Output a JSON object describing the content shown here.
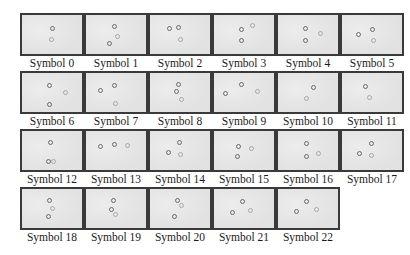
{
  "symbols": [
    {
      "label": "Symbol 0",
      "dots": [
        {
          "x": 30,
          "y": 13
        },
        {
          "x": 29,
          "y": 24,
          "faint": true
        }
      ]
    },
    {
      "label": "Symbol 1",
      "dots": [
        {
          "x": 28,
          "y": 11
        },
        {
          "x": 23,
          "y": 28
        },
        {
          "x": 31,
          "y": 21,
          "faint": true
        }
      ]
    },
    {
      "label": "Symbol 2",
      "dots": [
        {
          "x": 19,
          "y": 13
        },
        {
          "x": 28,
          "y": 12
        },
        {
          "x": 30,
          "y": 24,
          "faint": true
        }
      ]
    },
    {
      "label": "Symbol 3",
      "dots": [
        {
          "x": 27,
          "y": 14
        },
        {
          "x": 27,
          "y": 25
        },
        {
          "x": 38,
          "y": 10,
          "faint": true
        }
      ]
    },
    {
      "label": "Symbol 4",
      "dots": [
        {
          "x": 27,
          "y": 13
        },
        {
          "x": 27,
          "y": 25
        },
        {
          "x": 42,
          "y": 18,
          "faint": true
        }
      ]
    },
    {
      "label": "Symbol 5",
      "dots": [
        {
          "x": 30,
          "y": 14
        },
        {
          "x": 16,
          "y": 19
        },
        {
          "x": 31,
          "y": 25,
          "faint": true
        }
      ]
    },
    {
      "label": "Symbol 6",
      "dots": [
        {
          "x": 27,
          "y": 12
        },
        {
          "x": 27,
          "y": 31
        },
        {
          "x": 43,
          "y": 19,
          "faint": true
        }
      ]
    },
    {
      "label": "Symbol 7",
      "dots": [
        {
          "x": 28,
          "y": 12
        },
        {
          "x": 14,
          "y": 17
        },
        {
          "x": 29,
          "y": 30,
          "faint": true
        }
      ]
    },
    {
      "label": "Symbol 8",
      "dots": [
        {
          "x": 28,
          "y": 11
        },
        {
          "x": 26,
          "y": 18
        },
        {
          "x": 31,
          "y": 26,
          "faint": true
        }
      ]
    },
    {
      "label": "Symbol 9",
      "dots": [
        {
          "x": 27,
          "y": 11
        },
        {
          "x": 11,
          "y": 20
        },
        {
          "x": 43,
          "y": 18,
          "faint": true
        }
      ]
    },
    {
      "label": "Symbol 10",
      "dots": [
        {
          "x": 35,
          "y": 14
        },
        {
          "x": 28,
          "y": 25,
          "faint": true
        }
      ]
    },
    {
      "label": "Symbol 11",
      "dots": [
        {
          "x": 23,
          "y": 13
        },
        {
          "x": 27,
          "y": 24,
          "faint": true
        }
      ]
    },
    {
      "label": "Symbol 12",
      "dots": [
        {
          "x": 28,
          "y": 11
        },
        {
          "x": 26,
          "y": 30
        },
        {
          "x": 31,
          "y": 30,
          "faint": true
        }
      ]
    },
    {
      "label": "Symbol 13",
      "dots": [
        {
          "x": 14,
          "y": 15
        },
        {
          "x": 28,
          "y": 13
        },
        {
          "x": 41,
          "y": 14,
          "faint": true
        }
      ]
    },
    {
      "label": "Symbol 14",
      "dots": [
        {
          "x": 29,
          "y": 11
        },
        {
          "x": 18,
          "y": 21
        },
        {
          "x": 30,
          "y": 23,
          "faint": true
        }
      ]
    },
    {
      "label": "Symbol 15",
      "dots": [
        {
          "x": 24,
          "y": 15
        },
        {
          "x": 23,
          "y": 25
        },
        {
          "x": 37,
          "y": 17,
          "faint": true
        }
      ]
    },
    {
      "label": "Symbol 16",
      "dots": [
        {
          "x": 28,
          "y": 12
        },
        {
          "x": 28,
          "y": 25
        },
        {
          "x": 40,
          "y": 22,
          "faint": true
        }
      ]
    },
    {
      "label": "Symbol 17",
      "dots": [
        {
          "x": 29,
          "y": 12
        },
        {
          "x": 17,
          "y": 22
        },
        {
          "x": 29,
          "y": 24,
          "faint": true
        }
      ]
    },
    {
      "label": "Symbol 18",
      "dots": [
        {
          "x": 27,
          "y": 11
        },
        {
          "x": 26,
          "y": 27
        },
        {
          "x": 30,
          "y": 19,
          "faint": true
        }
      ]
    },
    {
      "label": "Symbol 19",
      "dots": [
        {
          "x": 27,
          "y": 11
        },
        {
          "x": 25,
          "y": 20
        },
        {
          "x": 29,
          "y": 25,
          "faint": true
        }
      ]
    },
    {
      "label": "Symbol 20",
      "dots": [
        {
          "x": 27,
          "y": 11
        },
        {
          "x": 24,
          "y": 27
        },
        {
          "x": 31,
          "y": 16,
          "faint": true
        }
      ]
    },
    {
      "label": "Symbol 21",
      "dots": [
        {
          "x": 28,
          "y": 12
        },
        {
          "x": 18,
          "y": 23
        },
        {
          "x": 36,
          "y": 21,
          "faint": true
        }
      ]
    },
    {
      "label": "Symbol 22",
      "dots": [
        {
          "x": 28,
          "y": 12
        },
        {
          "x": 18,
          "y": 22
        },
        {
          "x": 38,
          "y": 20,
          "faint": true
        }
      ]
    }
  ],
  "layout": {
    "columns": 6,
    "origin_x": 20,
    "origin_y": 13,
    "step_x": 64,
    "step_y": 58
  },
  "colors": {
    "background": "#ffffff",
    "tile_fill": "#e6e6e6",
    "tile_border": "#3a3a3a",
    "dot": "#6a6a6a",
    "dot_faint": "#a8a8a8",
    "label": "#1a1a1a"
  }
}
